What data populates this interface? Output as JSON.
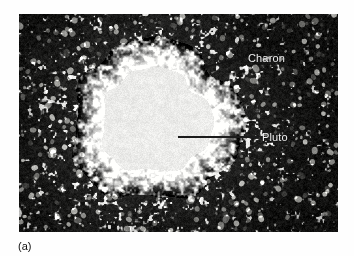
{
  "figure": {
    "caption_label": "(a)",
    "photo_alt_name": "pluto-charon-photographic-plate",
    "background_color": "#fefefe",
    "plate_dark_color": "#0a0a0a",
    "plate_bright_color": "#f0efe9",
    "annotation_color": "#f2f2f2",
    "leader_line_color": "#1a1a1a",
    "plate_bounds": {
      "x": 19,
      "y": 14,
      "width": 319,
      "height": 218
    }
  },
  "annotations": [
    {
      "id": "charon",
      "label": "Charon",
      "label_x": 248,
      "label_y": 52,
      "pointer_type": "arrow",
      "pointer_from_x": 246,
      "pointer_from_y": 57,
      "pointer_to_x": 200,
      "pointer_to_y": 68
    },
    {
      "id": "pluto",
      "label": "Pluto",
      "label_x": 262,
      "label_y": 131,
      "pointer_type": "line",
      "pointer_from_x": 259,
      "pointer_from_y": 137,
      "pointer_to_x": 178,
      "pointer_to_y": 137
    }
  ],
  "scene": {
    "title": "Pluto and Charon telescopic image",
    "bright_blob": {
      "center_x": 155,
      "center_y": 121,
      "radius_x": 66,
      "radius_y": 62
    },
    "grain": {
      "description": "high-contrast photographic grain, dark field with bright speckles",
      "speckle_count": 520
    }
  }
}
